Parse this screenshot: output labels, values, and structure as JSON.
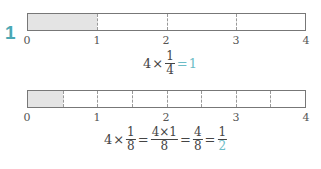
{
  "problem_number": "1",
  "colors": {
    "marker": "#4aa8b4",
    "answer": "#6cbcc6",
    "shade": "#e4e4e4"
  },
  "bar1": {
    "divisions": 4,
    "shaded_parts": 1,
    "ticks": [
      "0",
      "1",
      "2",
      "3",
      "4"
    ],
    "equation": {
      "whole": "4",
      "times": "×",
      "frac": {
        "num": "1",
        "den": "4"
      },
      "equals": "=",
      "result": "1"
    }
  },
  "bar2": {
    "divisions": 8,
    "shaded_parts": 1,
    "ticks": [
      "0",
      "1",
      "2",
      "3",
      "4"
    ],
    "equation": {
      "whole": "4",
      "times": "×",
      "frac1": {
        "num": "1",
        "den": "8"
      },
      "eq1": "=",
      "frac2": {
        "num": "4×1",
        "den": "8"
      },
      "eq2": "=",
      "frac3": {
        "num": "4",
        "den": "8"
      },
      "eq3": "=",
      "result": {
        "num": "1",
        "den": "2"
      }
    }
  }
}
